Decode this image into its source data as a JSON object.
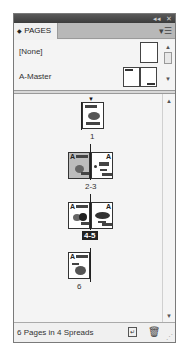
{
  "panel": {
    "title_controls": {
      "collapse": "◂◂",
      "close": "✕"
    },
    "tab": {
      "icon": "◆",
      "label": "PAGES"
    },
    "menu_icon": "▾☰"
  },
  "masters": [
    {
      "label": "[None]"
    },
    {
      "label": "A-Master"
    }
  ],
  "spreads": [
    {
      "label": "1",
      "pages": 1,
      "selected": false,
      "master_prefix": ""
    },
    {
      "label": "2-3",
      "pages": 2,
      "selected": false,
      "master_prefix": "A"
    },
    {
      "label": "4-5",
      "pages": 2,
      "selected": true,
      "master_prefix": "A"
    },
    {
      "label": "6",
      "pages": 1,
      "selected": false,
      "master_prefix": "A"
    }
  ],
  "footer": {
    "status": "6 Pages in 4 Spreads",
    "new_page_icon": "new-page",
    "delete_icon": "trash"
  },
  "icons": {
    "scroll_up": "▲",
    "scroll_down": "▼",
    "page_marker": "▼",
    "grip": "⋰"
  }
}
